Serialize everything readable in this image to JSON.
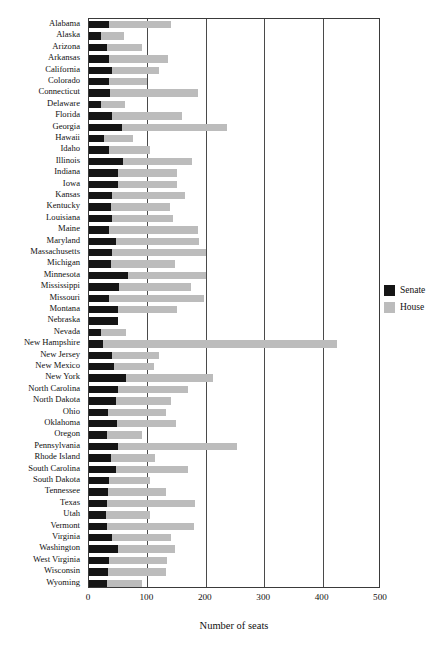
{
  "chart_data": {
    "type": "bar",
    "orientation": "horizontal",
    "stacked": true,
    "title": "",
    "xlabel": "Number of seats",
    "ylabel": "",
    "xlim": [
      0,
      500
    ],
    "xticks": [
      0,
      100,
      200,
      300,
      400,
      500
    ],
    "gridlines": [
      100,
      200,
      300,
      400
    ],
    "grid": true,
    "legend_position": "right",
    "colors": {
      "senate": "#151515",
      "house": "#bcbcbc"
    },
    "categories": [
      "Alabama",
      "Alaska",
      "Arizona",
      "Arkansas",
      "California",
      "Colorado",
      "Connecticut",
      "Delaware",
      "Florida",
      "Georgia",
      "Hawaii",
      "Idaho",
      "Illinois",
      "Indiana",
      "Iowa",
      "Kansas",
      "Kentucky",
      "Louisiana",
      "Maine",
      "Maryland",
      "Massachusetts",
      "Michigan",
      "Minnesota",
      "Mississippi",
      "Missouri",
      "Montana",
      "Nebraska",
      "Nevada",
      "New Hampshire",
      "New Jersey",
      "New Mexico",
      "New York",
      "North Carolina",
      "North Dakota",
      "Ohio",
      "Oklahoma",
      "Oregon",
      "Pennsylvania",
      "Rhode Island",
      "South Carolina",
      "South Dakota",
      "Tennessee",
      "Texas",
      "Utah",
      "Vermont",
      "Virginia",
      "Washington",
      "West Virginia",
      "Wisconsin",
      "Wyoming"
    ],
    "series": [
      {
        "name": "Senate",
        "color": "#151515",
        "values": [
          35,
          20,
          30,
          35,
          40,
          35,
          36,
          21,
          40,
          56,
          25,
          35,
          59,
          50,
          50,
          40,
          38,
          39,
          35,
          47,
          40,
          38,
          67,
          52,
          34,
          50,
          49,
          21,
          24,
          40,
          42,
          63,
          50,
          47,
          33,
          48,
          30,
          50,
          38,
          46,
          35,
          33,
          31,
          29,
          30,
          40,
          49,
          34,
          33,
          30
        ]
      },
      {
        "name": "House",
        "color": "#bcbcbc",
        "values": [
          105,
          40,
          60,
          100,
          80,
          65,
          151,
          41,
          120,
          180,
          51,
          70,
          118,
          100,
          100,
          125,
          100,
          105,
          151,
          141,
          160,
          110,
          134,
          122,
          163,
          100,
          0,
          42,
          400,
          80,
          70,
          150,
          120,
          94,
          99,
          101,
          60,
          203,
          75,
          124,
          70,
          99,
          150,
          75,
          150,
          100,
          98,
          100,
          99,
          60
        ]
      }
    ],
    "totals": [
      140,
      60,
      90,
      135,
      120,
      100,
      187,
      62,
      160,
      236,
      76,
      105,
      177,
      150,
      150,
      165,
      138,
      144,
      186,
      188,
      200,
      148,
      201,
      174,
      197,
      150,
      49,
      63,
      424,
      120,
      112,
      213,
      170,
      141,
      132,
      149,
      90,
      253,
      113,
      170,
      105,
      132,
      181,
      104,
      180,
      140,
      147,
      134,
      132,
      90
    ]
  },
  "legend": {
    "items": [
      {
        "label": "Senate",
        "color": "#151515"
      },
      {
        "label": "House",
        "color": "#bcbcbc"
      }
    ]
  }
}
